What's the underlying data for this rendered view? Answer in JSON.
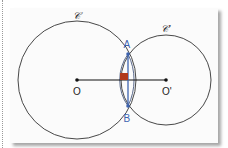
{
  "figure": {
    "circle_c": {
      "label": "𝒞",
      "cx": 77,
      "cy": 80,
      "r": 59
    },
    "circle_c_prime": {
      "label": "𝒞'",
      "cx": 166,
      "cy": 80,
      "r": 45
    },
    "points": {
      "O": {
        "label": "O",
        "x": 77,
        "y": 80
      },
      "O_prime": {
        "label": "O'",
        "x": 166,
        "y": 80
      },
      "A": {
        "label": "A",
        "x": 128,
        "y": 54
      },
      "B": {
        "label": "B",
        "x": 128,
        "y": 106
      }
    },
    "colors": {
      "circle": "#333333",
      "segment_OO": "#111111",
      "segment_AB": "#3d63b0",
      "right_angle": "#b23a1e"
    }
  }
}
